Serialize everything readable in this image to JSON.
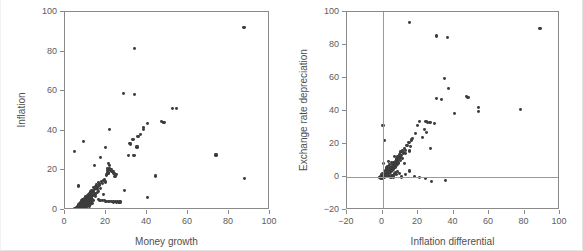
{
  "figure": {
    "background_color": "#ffffff",
    "marker_color": "#3d3d3d",
    "axis_color": "#8a8a8a",
    "reference_line_color": "#9a9a9a"
  },
  "chart_data": [
    {
      "type": "scatter",
      "panel": "left",
      "title": "",
      "xlabel": "Money growth",
      "ylabel": "Inflation",
      "xlim": [
        0,
        100
      ],
      "ylim": [
        0,
        100
      ],
      "xticks": [
        0,
        20,
        40,
        60,
        80,
        100
      ],
      "yticks": [
        0,
        20,
        40,
        60,
        80,
        100
      ],
      "xticklabels": [
        "0",
        "20",
        "40",
        "60",
        "80",
        "100"
      ],
      "yticklabels": [
        "0",
        "20",
        "40",
        "60",
        "80",
        "100"
      ],
      "grid": false,
      "legend": null,
      "reference_lines": [],
      "points": [
        [
          87.3,
          92.2
        ],
        [
          33.9,
          81.5
        ],
        [
          28.6,
          59.0
        ],
        [
          33.9,
          58.3
        ],
        [
          52.6,
          51.4
        ],
        [
          54.4,
          51.4
        ],
        [
          46.9,
          44.6
        ],
        [
          47.9,
          44.3
        ],
        [
          48.3,
          44.1
        ],
        [
          40.1,
          43.5
        ],
        [
          38.3,
          41.6
        ],
        [
          38.4,
          40.6
        ],
        [
          21.9,
          40.5
        ],
        [
          37.0,
          38.1
        ],
        [
          35.6,
          37.3
        ],
        [
          33.2,
          35.5
        ],
        [
          9.0,
          34.4
        ],
        [
          31.5,
          33.5
        ],
        [
          32.0,
          33.3
        ],
        [
          35.1,
          31.8
        ],
        [
          19.7,
          31.6
        ],
        [
          4.6,
          29.6
        ],
        [
          73.7,
          27.8
        ],
        [
          30.9,
          27.5
        ],
        [
          33.7,
          27.4
        ],
        [
          17.2,
          26.5
        ],
        [
          21.4,
          23.3
        ],
        [
          21.8,
          22.6
        ],
        [
          14.5,
          22.4
        ],
        [
          20.8,
          21.1
        ],
        [
          21.6,
          20.7
        ],
        [
          22.4,
          20.2
        ],
        [
          20.6,
          19.8
        ],
        [
          22.9,
          19.6
        ],
        [
          23.5,
          19.4
        ],
        [
          21.0,
          18.7
        ],
        [
          21.3,
          18.5
        ],
        [
          23.9,
          18.3
        ],
        [
          25.0,
          18.1
        ],
        [
          20.3,
          17.7
        ],
        [
          44.2,
          17.2
        ],
        [
          24.4,
          16.9
        ],
        [
          87.4,
          15.9
        ],
        [
          19.1,
          15.3
        ],
        [
          18.6,
          14.8
        ],
        [
          17.8,
          14.4
        ],
        [
          19.9,
          14.1
        ],
        [
          16.2,
          13.8
        ],
        [
          17.0,
          13.5
        ],
        [
          18.1,
          13.2
        ],
        [
          15.4,
          12.9
        ],
        [
          16.8,
          12.6
        ],
        [
          6.4,
          12.1
        ],
        [
          14.9,
          11.9
        ],
        [
          16.0,
          11.6
        ],
        [
          13.8,
          11.3
        ],
        [
          15.1,
          11.0
        ],
        [
          17.5,
          10.8
        ],
        [
          14.2,
          10.5
        ],
        [
          15.7,
          10.2
        ],
        [
          29.2,
          10.0
        ],
        [
          13.1,
          9.8
        ],
        [
          14.0,
          9.6
        ],
        [
          16.5,
          9.4
        ],
        [
          12.5,
          9.1
        ],
        [
          13.4,
          8.9
        ],
        [
          15.9,
          8.7
        ],
        [
          11.9,
          8.5
        ],
        [
          12.9,
          8.3
        ],
        [
          14.6,
          8.1
        ],
        [
          18.9,
          8.0
        ],
        [
          11.3,
          7.8
        ],
        [
          12.2,
          7.6
        ],
        [
          13.7,
          7.4
        ],
        [
          10.8,
          7.2
        ],
        [
          11.7,
          7.0
        ],
        [
          13.0,
          6.9
        ],
        [
          14.8,
          6.7
        ],
        [
          9.9,
          6.6
        ],
        [
          10.5,
          6.4
        ],
        [
          11.5,
          6.3
        ],
        [
          12.7,
          6.1
        ],
        [
          40.2,
          6.2
        ],
        [
          9.4,
          6.0
        ],
        [
          10.2,
          5.8
        ],
        [
          11.1,
          5.7
        ],
        [
          12.0,
          5.5
        ],
        [
          13.3,
          5.4
        ],
        [
          8.8,
          5.3
        ],
        [
          9.7,
          5.1
        ],
        [
          10.6,
          5.0
        ],
        [
          11.6,
          4.9
        ],
        [
          12.6,
          4.7
        ],
        [
          14.1,
          4.6
        ],
        [
          8.2,
          4.5
        ],
        [
          9.1,
          4.4
        ],
        [
          10.0,
          4.3
        ],
        [
          10.9,
          4.2
        ],
        [
          11.8,
          4.1
        ],
        [
          12.8,
          4.0
        ],
        [
          7.6,
          3.9
        ],
        [
          8.5,
          3.8
        ],
        [
          9.3,
          3.7
        ],
        [
          10.3,
          3.6
        ],
        [
          11.2,
          3.5
        ],
        [
          12.3,
          3.4
        ],
        [
          13.6,
          3.3
        ],
        [
          7.0,
          3.2
        ],
        [
          7.9,
          3.1
        ],
        [
          8.7,
          3.0
        ],
        [
          9.6,
          2.9
        ],
        [
          10.4,
          2.8
        ],
        [
          11.4,
          2.7
        ],
        [
          12.4,
          2.6
        ],
        [
          6.5,
          2.5
        ],
        [
          7.3,
          2.4
        ],
        [
          8.1,
          2.3
        ],
        [
          9.0,
          2.2
        ],
        [
          9.8,
          2.1
        ],
        [
          10.7,
          2.0
        ],
        [
          11.9,
          1.9
        ],
        [
          6.0,
          1.8
        ],
        [
          6.8,
          1.7
        ],
        [
          7.5,
          1.6
        ],
        [
          8.4,
          1.5
        ],
        [
          9.2,
          1.4
        ],
        [
          10.1,
          1.3
        ],
        [
          5.5,
          1.2
        ],
        [
          6.2,
          1.1
        ],
        [
          7.1,
          1.0
        ],
        [
          7.8,
          0.9
        ],
        [
          8.6,
          0.8
        ],
        [
          4.9,
          0.7
        ],
        [
          5.8,
          0.6
        ],
        [
          6.6,
          0.5
        ],
        [
          20.0,
          4.3
        ],
        [
          21.5,
          4.2
        ],
        [
          22.6,
          4.1
        ],
        [
          23.8,
          4.0
        ],
        [
          25.2,
          3.9
        ],
        [
          26.3,
          3.8
        ],
        [
          24.6,
          4.4
        ],
        [
          19.4,
          4.6
        ],
        [
          18.3,
          4.8
        ],
        [
          17.1,
          5.0
        ],
        [
          16.3,
          5.2
        ],
        [
          26.8,
          4.0
        ],
        [
          25.8,
          4.2
        ]
      ]
    },
    {
      "type": "scatter",
      "panel": "right",
      "title": "",
      "xlabel": "Inflation differential",
      "ylabel": "Exchange rate depreciation",
      "xlim": [
        -20,
        100
      ],
      "ylim": [
        -20,
        100
      ],
      "xticks": [
        -20,
        0,
        20,
        40,
        60,
        80,
        100
      ],
      "yticks": [
        -20,
        0,
        20,
        40,
        60,
        80,
        100
      ],
      "xticklabels": [
        "−20",
        "0",
        "20",
        "40",
        "60",
        "80",
        "100"
      ],
      "yticklabels": [
        "−20",
        "0",
        "20",
        "40",
        "60",
        "80",
        "100"
      ],
      "grid": false,
      "legend": null,
      "reference_lines": [
        {
          "axis": "x",
          "value": 0
        },
        {
          "axis": "y",
          "value": 0
        }
      ],
      "points": [
        [
          15.0,
          93.5
        ],
        [
          88.7,
          90.2
        ],
        [
          30.6,
          85.5
        ],
        [
          36.5,
          84.4
        ],
        [
          34.8,
          59.5
        ],
        [
          37.4,
          53.6
        ],
        [
          47.5,
          49.0
        ],
        [
          48.2,
          48.2
        ],
        [
          30.3,
          47.6
        ],
        [
          33.4,
          47.1
        ],
        [
          54.2,
          42.2
        ],
        [
          77.6,
          40.9
        ],
        [
          54.0,
          39.9
        ],
        [
          40.6,
          38.5
        ],
        [
          20.8,
          33.6
        ],
        [
          26.8,
          32.9
        ],
        [
          29.1,
          32.5
        ],
        [
          24.5,
          33.4
        ],
        [
          25.4,
          33.1
        ],
        [
          0.3,
          31.3
        ],
        [
          19.8,
          31.0
        ],
        [
          23.7,
          29.0
        ],
        [
          24.9,
          27.0
        ],
        [
          18.6,
          26.3
        ],
        [
          1.0,
          22.2
        ],
        [
          17.1,
          23.2
        ],
        [
          16.2,
          22.4
        ],
        [
          14.9,
          21.0
        ],
        [
          13.8,
          19.3
        ],
        [
          15.6,
          18.7
        ],
        [
          12.6,
          17.5
        ],
        [
          26.9,
          17.2
        ],
        [
          11.4,
          16.3
        ],
        [
          13.1,
          16.0
        ],
        [
          15.1,
          15.8
        ],
        [
          10.3,
          15.1
        ],
        [
          11.9,
          14.6
        ],
        [
          12.8,
          14.2
        ],
        [
          9.5,
          13.4
        ],
        [
          10.8,
          13.0
        ],
        [
          8.7,
          12.2
        ],
        [
          9.9,
          11.8
        ],
        [
          11.2,
          11.4
        ],
        [
          7.9,
          10.9
        ],
        [
          8.9,
          10.5
        ],
        [
          10.1,
          10.1
        ],
        [
          7.2,
          9.6
        ],
        [
          8.2,
          9.2
        ],
        [
          9.2,
          8.9
        ],
        [
          6.5,
          8.5
        ],
        [
          7.5,
          8.2
        ],
        [
          8.5,
          7.9
        ],
        [
          0.5,
          8.4
        ],
        [
          9.0,
          8.1
        ],
        [
          5.9,
          7.5
        ],
        [
          6.8,
          7.1
        ],
        [
          7.7,
          6.8
        ],
        [
          5.2,
          6.4
        ],
        [
          6.1,
          6.1
        ],
        [
          7.0,
          5.8
        ],
        [
          4.6,
          5.4
        ],
        [
          5.5,
          5.1
        ],
        [
          6.3,
          4.8
        ],
        [
          4.0,
          4.5
        ],
        [
          4.9,
          4.2
        ],
        [
          5.7,
          3.9
        ],
        [
          3.4,
          3.7
        ],
        [
          4.2,
          3.4
        ],
        [
          5.0,
          3.2
        ],
        [
          2.8,
          3.0
        ],
        [
          3.6,
          2.8
        ],
        [
          4.4,
          2.6
        ],
        [
          2.2,
          2.4
        ],
        [
          3.0,
          2.2
        ],
        [
          3.8,
          2.0
        ],
        [
          1.6,
          1.9
        ],
        [
          2.4,
          1.7
        ],
        [
          3.2,
          1.5
        ],
        [
          1.0,
          1.4
        ],
        [
          1.8,
          1.2
        ],
        [
          2.6,
          1.1
        ],
        [
          0.4,
          0.9
        ],
        [
          1.2,
          0.8
        ],
        [
          2.0,
          0.6
        ],
        [
          -0.2,
          0.5
        ],
        [
          0.6,
          0.4
        ],
        [
          1.4,
          0.2
        ],
        [
          -0.8,
          0.1
        ],
        [
          0.0,
          0.0
        ],
        [
          0.8,
          -0.1
        ],
        [
          -1.4,
          -0.2
        ],
        [
          -0.6,
          -0.3
        ],
        [
          0.2,
          -0.4
        ],
        [
          -1.9,
          -0.5
        ],
        [
          -1.1,
          -0.6
        ],
        [
          -0.3,
          -0.7
        ],
        [
          1.9,
          0.3
        ],
        [
          2.9,
          0.5
        ],
        [
          3.9,
          0.1
        ],
        [
          4.8,
          -0.2
        ],
        [
          6.0,
          0.0
        ],
        [
          8.0,
          1.4
        ],
        [
          10.5,
          0.0
        ],
        [
          15.3,
          3.6
        ],
        [
          21.0,
          -0.3
        ],
        [
          24.2,
          -0.9
        ],
        [
          27.6,
          -2.5
        ],
        [
          35.4,
          -2.3
        ],
        [
          13.0,
          1.5
        ],
        [
          18.0,
          0.2
        ],
        [
          5.4,
          1.0
        ],
        [
          9.6,
          2.1
        ],
        [
          2.1,
          5.5
        ],
        [
          3.1,
          6.2
        ],
        [
          6.6,
          1.8
        ],
        [
          7.4,
          2.4
        ],
        [
          8.3,
          3.1
        ],
        [
          4.1,
          7.6
        ],
        [
          5.1,
          8.8
        ],
        [
          12.2,
          8.4
        ],
        [
          1.5,
          4.0
        ],
        [
          2.5,
          4.8
        ],
        [
          0.9,
          3.3
        ],
        [
          0.1,
          2.0
        ],
        [
          -0.5,
          1.3
        ],
        [
          3.5,
          9.4
        ],
        [
          6.9,
          12.6
        ],
        [
          22.4,
          23.8
        ]
      ]
    }
  ]
}
